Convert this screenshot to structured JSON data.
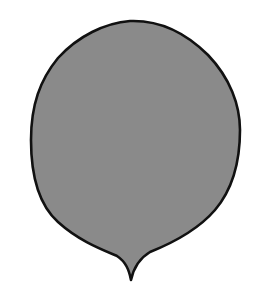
{
  "figure": {
    "fill_color": "#8a8a8a",
    "stroke_color": "#111111",
    "background_color": "#ffffff"
  }
}
